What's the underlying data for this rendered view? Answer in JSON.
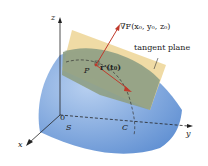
{
  "figure": {
    "axes": {
      "z": "z",
      "y": "y",
      "x": "x",
      "origin": "0"
    },
    "labels": {
      "gradient": "∇F(x₀, y₀, z₀)",
      "tangent_plane": "tangent plane",
      "point": "P",
      "tangent_vector": "r′(t₀)",
      "surface": "S",
      "curve": "C"
    },
    "colors": {
      "surface": "#6f9bd8",
      "surface_light": "#a9c6ee",
      "tangent_plane": "#efd9a0",
      "plane_overlap": "#8e9e84",
      "vector": "#c0392b",
      "axes": "#222222"
    }
  }
}
